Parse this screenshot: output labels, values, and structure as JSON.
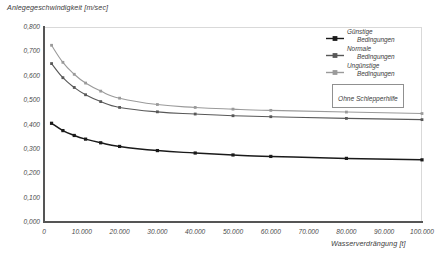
{
  "chart_data": {
    "type": "line",
    "title": "",
    "ylabel": "Anlegegeschwindigkeit [m/sec]",
    "xlabel": "Wasserverdrängung [t]",
    "xlim": [
      0,
      100000
    ],
    "ylim": [
      0,
      0.8
    ],
    "grid": false,
    "legend_position": "top-right",
    "annotation": "Ohne Schlepperhilfe",
    "xticks": [
      "0",
      "10.000",
      "20.000",
      "30.000",
      "40.000",
      "50.000",
      "60.000",
      "70.000",
      "80.000",
      "90.000",
      "100.000"
    ],
    "xtick_values": [
      0,
      10000,
      20000,
      30000,
      40000,
      50000,
      60000,
      70000,
      80000,
      90000,
      100000
    ],
    "yticks": [
      "0,000",
      "0,100",
      "0,200",
      "0,300",
      "0,400",
      "0,500",
      "0,600",
      "0,700",
      "0,800"
    ],
    "ytick_values": [
      0,
      0.1,
      0.2,
      0.3,
      0.4,
      0.5,
      0.6,
      0.7,
      0.8
    ],
    "x": [
      2000,
      5000,
      8000,
      11000,
      15000,
      20000,
      30000,
      40000,
      50000,
      60000,
      80000,
      100000
    ],
    "series": [
      {
        "name": "Günstige Bedingungen",
        "label_line1": "Günstige",
        "label_line2": "Bedingungen",
        "color": "#1a1a1a",
        "marker": "square",
        "values": [
          0.405,
          0.375,
          0.355,
          0.34,
          0.325,
          0.31,
          0.293,
          0.283,
          0.275,
          0.269,
          0.261,
          0.255
        ]
      },
      {
        "name": "Normale Bedingungen",
        "label_line1": "Normale",
        "label_line2": "Bedingungen",
        "color": "#585858",
        "marker": "square",
        "values": [
          0.65,
          0.592,
          0.552,
          0.522,
          0.494,
          0.47,
          0.452,
          0.443,
          0.436,
          0.432,
          0.425,
          0.42
        ]
      },
      {
        "name": "Ungünstige Bedingungen",
        "label_line1": "Ungünstige",
        "label_line2": "Bedingungen",
        "color": "#9a9a9a",
        "marker": "square",
        "values": [
          0.725,
          0.655,
          0.606,
          0.57,
          0.537,
          0.508,
          0.482,
          0.47,
          0.463,
          0.458,
          0.451,
          0.445
        ]
      }
    ]
  }
}
